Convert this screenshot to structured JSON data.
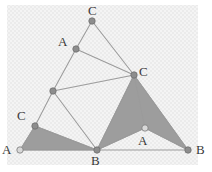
{
  "figure": {
    "width": 212,
    "height": 172,
    "colors": {
      "background": "#ffffff",
      "texture": "#f2f2f2",
      "shade": "#9d9d9d",
      "edge": "#9b9b9b",
      "vertex": "#8d8d8d",
      "vertex_open": "#d8d8d8",
      "label": "#3a3a3a"
    },
    "texture_region": {
      "x": 7,
      "y": 5,
      "width": 191,
      "height": 160
    },
    "vertices": [
      {
        "id": "c-top",
        "label": "C",
        "x": 92,
        "y": 21,
        "style": "filled",
        "label_x": 88,
        "label_y": 4
      },
      {
        "id": "a-upper",
        "label": "A",
        "x": 76,
        "y": 49,
        "style": "filled",
        "label_x": 58,
        "label_y": 35
      },
      {
        "id": "c-right",
        "label": "C",
        "x": 134,
        "y": 75,
        "style": "filled",
        "label_x": 139,
        "label_y": 65
      },
      {
        "id": "mid",
        "label": "",
        "x": 53,
        "y": 91,
        "style": "filled",
        "label_x": 0,
        "label_y": 0
      },
      {
        "id": "c-left",
        "label": "C",
        "x": 35,
        "y": 126,
        "style": "filled",
        "label_x": 17,
        "label_y": 109
      },
      {
        "id": "a-left",
        "label": "A",
        "x": 20,
        "y": 150,
        "style": "open",
        "label_x": 2,
        "label_y": 143
      },
      {
        "id": "b-bottom",
        "label": "B",
        "x": 97,
        "y": 150,
        "style": "filled",
        "label_x": 91,
        "label_y": 154
      },
      {
        "id": "a-right",
        "label": "A",
        "x": 145,
        "y": 128,
        "style": "open",
        "label_x": 138,
        "label_y": 134
      },
      {
        "id": "b-right",
        "label": "B",
        "x": 188,
        "y": 150,
        "style": "filled",
        "label_x": 196,
        "label_y": 143
      }
    ],
    "shaded_polygons": [
      {
        "id": "left-triangle",
        "points": "20,150 35,126 97,150"
      },
      {
        "id": "right-dart",
        "points": "97,150 134,75 188,150 145,128"
      }
    ],
    "edges": [
      {
        "id": "c-top__a-upper",
        "x1": 92,
        "y1": 21,
        "x2": 76,
        "y2": 49
      },
      {
        "id": "c-top__c-right",
        "x1": 92,
        "y1": 21,
        "x2": 134,
        "y2": 75
      },
      {
        "id": "a-upper__c-right",
        "x1": 76,
        "y1": 49,
        "x2": 134,
        "y2": 75
      },
      {
        "id": "a-upper__mid",
        "x1": 76,
        "y1": 49,
        "x2": 53,
        "y2": 91
      },
      {
        "id": "mid__c-right",
        "x1": 53,
        "y1": 91,
        "x2": 134,
        "y2": 75
      },
      {
        "id": "mid__c-left",
        "x1": 53,
        "y1": 91,
        "x2": 35,
        "y2": 126
      },
      {
        "id": "mid__b-bottom",
        "x1": 53,
        "y1": 91,
        "x2": 97,
        "y2": 150
      },
      {
        "id": "c-right__b-bottom",
        "x1": 134,
        "y1": 75,
        "x2": 97,
        "y2": 150
      },
      {
        "id": "c-right__a-right",
        "x1": 134,
        "y1": 75,
        "x2": 145,
        "y2": 128
      },
      {
        "id": "c-right__b-right",
        "x1": 134,
        "y1": 75,
        "x2": 188,
        "y2": 150
      },
      {
        "id": "a-right__b-bottom",
        "x1": 145,
        "y1": 128,
        "x2": 97,
        "y2": 150
      },
      {
        "id": "a-right__b-right",
        "x1": 145,
        "y1": 128,
        "x2": 188,
        "y2": 150
      },
      {
        "id": "a-left__c-left",
        "x1": 20,
        "y1": 150,
        "x2": 35,
        "y2": 126
      },
      {
        "id": "c-left__b-bottom",
        "x1": 35,
        "y1": 126,
        "x2": 97,
        "y2": 150
      },
      {
        "id": "a-left__b-bottom",
        "x1": 20,
        "y1": 150,
        "x2": 97,
        "y2": 150
      },
      {
        "id": "b-bottom__b-right",
        "x1": 97,
        "y1": 150,
        "x2": 188,
        "y2": 150
      }
    ]
  }
}
